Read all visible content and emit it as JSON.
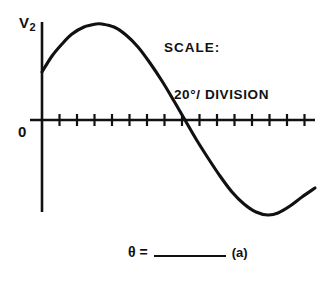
{
  "figure": {
    "title_y_axis": "V",
    "y_axis_subscript": "2",
    "origin_label": "0",
    "panel_label": "(a)"
  },
  "scale_note": {
    "title": "SCALE:",
    "value": "20°/ DIVISION"
  },
  "answer_prompt": {
    "symbol": "θ",
    "equals": "=",
    "blank": ""
  },
  "chart_data": {
    "type": "line",
    "title": "",
    "xlabel": "",
    "ylabel": "V2",
    "grid": false,
    "legend": null,
    "axis": {
      "x_start_px": 30,
      "x_end_px": 315,
      "baseline_px": 120,
      "y_top_px": 22,
      "y_bottom_px": 212,
      "y_axis_x_px": 42,
      "tick_count": 16,
      "tick_spacing_px": 17.5,
      "tick_half_length_px": 5,
      "units_per_division": 20,
      "unit_label": "degrees"
    },
    "series": [
      {
        "name": "V2",
        "description": "sine wave, one full cycle, starting mid-rise above zero",
        "points_px": [
          [
            42,
            72
          ],
          [
            52,
            56
          ],
          [
            62,
            44
          ],
          [
            72,
            34
          ],
          [
            84,
            27
          ],
          [
            96,
            24
          ],
          [
            102,
            24
          ],
          [
            114,
            27
          ],
          [
            126,
            35
          ],
          [
            138,
            47
          ],
          [
            150,
            63
          ],
          [
            162,
            81
          ],
          [
            174,
            101
          ],
          [
            185,
            120
          ],
          [
            196,
            139
          ],
          [
            208,
            158
          ],
          [
            220,
            176
          ],
          [
            232,
            192
          ],
          [
            244,
            204
          ],
          [
            256,
            212
          ],
          [
            268,
            215
          ],
          [
            278,
            213
          ],
          [
            290,
            206
          ],
          [
            302,
            197
          ],
          [
            315,
            188
          ]
        ]
      }
    ],
    "annotations": [
      {
        "text": "V2",
        "x_px": 22,
        "y_px": 22
      },
      {
        "text": "0",
        "x_px": 20,
        "y_px": 131
      },
      {
        "text": "SCALE:",
        "x_px": 168,
        "y_px": 22
      },
      {
        "text": "20°/ DIVISION",
        "x_px": 176,
        "y_px": 42
      },
      {
        "text": "θ = ______ (a)",
        "x_px": 130,
        "y_px": 250
      }
    ]
  }
}
